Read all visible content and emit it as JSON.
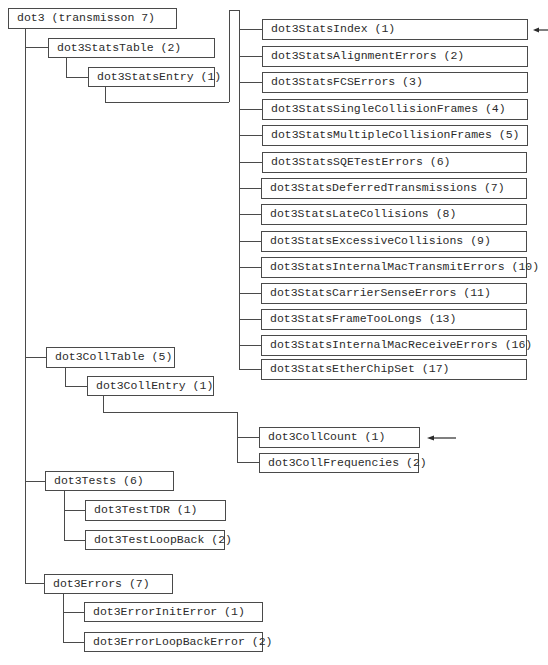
{
  "diagram": {
    "root": {
      "label": "dot3 (transmisson 7)"
    },
    "stats_table": {
      "label": "dot3StatsTable (2)",
      "entry": {
        "label": "dot3StatsEntry (1)"
      },
      "columns": [
        "dot3StatsIndex (1)",
        "dot3StatsAlignmentErrors (2)",
        "dot3StatsFCSErrors (3)",
        "dot3StatsSingleCollisionFrames (4)",
        "dot3StatsMultipleCollisionFrames (5)",
        "dot3StatsSQETestErrors (6)",
        "dot3StatsDeferredTransmissions (7)",
        "dot3StatsLateCollisions (8)",
        "dot3StatsExcessiveCollisions (9)",
        "dot3StatsInternalMacTransmitErrors (10)",
        "dot3StatsCarrierSenseErrors (11)",
        "dot3StatsFrameTooLongs (13)",
        "dot3StatsInternalMacReceiveErrors (16)",
        "dot3StatsEtherChipSet (17)"
      ]
    },
    "coll_table": {
      "label": "dot3CollTable (5)",
      "entry": {
        "label": "dot3CollEntry (1)"
      },
      "columns": [
        "dot3CollCount (1)",
        "dot3CollFrequencies (2)"
      ]
    },
    "tests": {
      "label": "dot3Tests (6)",
      "children": [
        "dot3TestTDR (1)",
        "dot3TestLoopBack (2)"
      ]
    },
    "errors": {
      "label": "dot3Errors (7)",
      "children": [
        "dot3ErrorInitError (1)",
        "dot3ErrorLoopBackError (2)"
      ]
    },
    "arrows": [
      {
        "points_to": "dot3StatsIndex (1)",
        "icon": "left-arrow-icon"
      },
      {
        "points_to": "dot3CollCount (1)",
        "icon": "left-arrow-icon"
      }
    ],
    "colors": {
      "line": "#4a4a4a",
      "text": "#2b2b2b",
      "background": "#ffffff"
    }
  }
}
